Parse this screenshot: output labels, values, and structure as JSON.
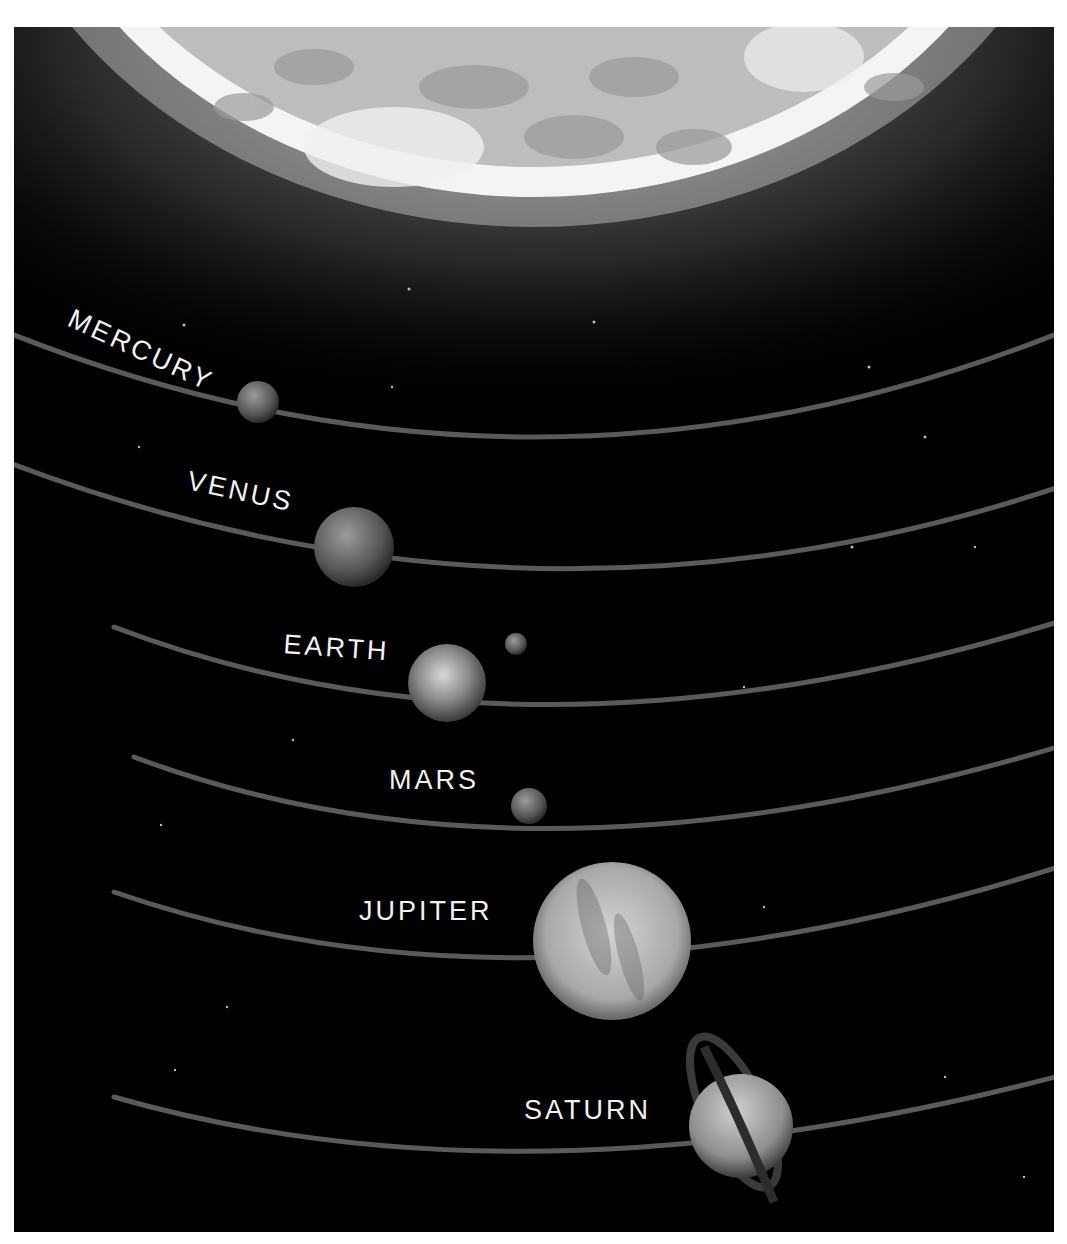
{
  "figure": {
    "background_color": "#000000",
    "sun": {
      "name": "Sun",
      "color": "#e8e8e8"
    },
    "orbit_color": "#5a5a5a",
    "label_color": "#f2f2f2"
  },
  "planets": [
    {
      "name": "MERCURY",
      "order": 1
    },
    {
      "name": "VENUS",
      "order": 2
    },
    {
      "name": "EARTH",
      "order": 3,
      "moon": "Moon"
    },
    {
      "name": "MARS",
      "order": 4
    },
    {
      "name": "JUPITER",
      "order": 5
    },
    {
      "name": "SATURN",
      "order": 6,
      "rings": true
    }
  ]
}
